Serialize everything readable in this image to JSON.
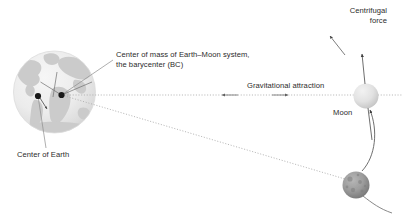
{
  "diagram": {
    "title_absent": true,
    "labels": {
      "barycenter": "Center of mass of Earth–Moon system,\nthe barycenter (BC)",
      "center_of_earth": "Center of Earth",
      "gravitational_attraction": "Gravitational attraction",
      "moon": "Moon",
      "centrifugal_force": "Centrifugal\nforce"
    },
    "bodies": {
      "earth": {
        "name": "Earth",
        "cx": 54.5,
        "cy": 92,
        "r": 41,
        "fill": "#e8e8e8",
        "land_fill": "#c9c9c9"
      },
      "moon_upper": {
        "name": "Moon",
        "cx": 366,
        "cy": 96,
        "r": 12.5,
        "fill": "#dcdcdc"
      },
      "moon_lower": {
        "name": "Moon",
        "cx": 356,
        "cy": 185,
        "r": 13.5,
        "fill": "#8e8e8e"
      }
    },
    "points": {
      "center_of_earth": {
        "cx": 38,
        "cy": 96,
        "r": 3.1
      },
      "barycenter": {
        "cx": 61.5,
        "cy": 95,
        "r": 3.1
      }
    },
    "colors": {
      "text": "#2b2b2b",
      "line": "#8c8c8c",
      "dot": "#1a1a1a",
      "dotted": "#a8a8a8"
    }
  }
}
